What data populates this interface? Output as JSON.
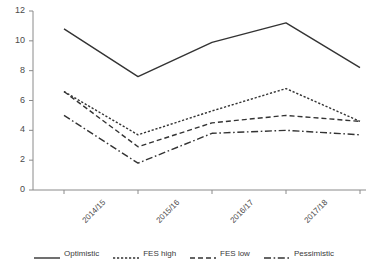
{
  "chart_data": {
    "type": "line",
    "title": "",
    "xlabel": "",
    "ylabel": "",
    "categories": [
      "2014/15",
      "2015/16",
      "2016/17",
      "2017/18",
      "2018/19"
    ],
    "ylim": [
      0,
      12
    ],
    "yticks": [
      0,
      2,
      4,
      6,
      8,
      10,
      12
    ],
    "grid": false,
    "legend_position": "bottom",
    "series": [
      {
        "name": "Optimistic",
        "style": "solid",
        "color": "#333333",
        "values": [
          10.8,
          7.6,
          9.9,
          11.2,
          8.2
        ]
      },
      {
        "name": "FES high",
        "style": "dotted",
        "color": "#333333",
        "values": [
          6.6,
          3.7,
          5.3,
          6.8,
          4.6
        ]
      },
      {
        "name": "FES low",
        "style": "dashed",
        "color": "#333333",
        "values": [
          6.6,
          2.9,
          4.5,
          5.0,
          4.6
        ]
      },
      {
        "name": "Pessimistic",
        "style": "dash-dot",
        "color": "#333333",
        "values": [
          5.0,
          1.8,
          3.8,
          4.0,
          3.7
        ]
      }
    ]
  },
  "axis": {
    "ytick_labels": [
      "12",
      "10",
      "8",
      "6",
      "4",
      "2",
      "0"
    ],
    "xtick_labels": [
      "2014/15",
      "2015/16",
      "2016/17",
      "2017/18",
      "2018/19"
    ]
  },
  "legend": {
    "items": [
      {
        "label": "Optimistic",
        "style": "solid"
      },
      {
        "label": "FES high",
        "style": "dotted"
      },
      {
        "label": "FES low",
        "style": "dashed"
      },
      {
        "label": "Pessimistic",
        "style": "dash-dot"
      }
    ]
  },
  "colors": {
    "line": "#333333",
    "axis": "#8a8a8a",
    "text": "#3a3a3a",
    "background": "#ffffff"
  }
}
